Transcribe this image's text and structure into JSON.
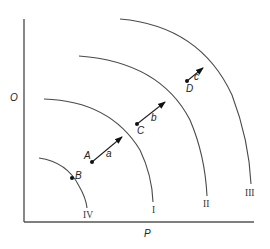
{
  "diagram": {
    "axes": {
      "y_label": "O",
      "x_label": "P"
    },
    "curves": [
      {
        "id": "IV",
        "label": "IV"
      },
      {
        "id": "I",
        "label": "I"
      },
      {
        "id": "II",
        "label": "II"
      },
      {
        "id": "III",
        "label": "III"
      }
    ],
    "points": [
      {
        "id": "A",
        "label": "A"
      },
      {
        "id": "B",
        "label": "B"
      },
      {
        "id": "C",
        "label": "C"
      },
      {
        "id": "D",
        "label": "D"
      }
    ],
    "arrows": [
      {
        "id": "a",
        "label": "a",
        "from": "A",
        "to_curve": "I"
      },
      {
        "id": "b",
        "label": "b",
        "from": "C",
        "to_curve": "II"
      },
      {
        "id": "c",
        "label": "c",
        "from": "D",
        "to_curve": "III"
      }
    ],
    "colors": {
      "line": "#4a4a4a",
      "axis": "#555555",
      "point": "#111111",
      "background": "#ffffff"
    }
  }
}
